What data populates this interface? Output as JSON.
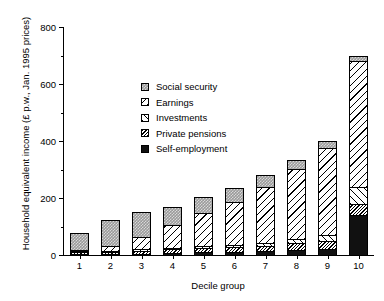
{
  "chart_data": {
    "type": "bar",
    "stacked": true,
    "title": "",
    "xlabel": "Decile group",
    "ylabel": "Household equivalent income (£ p.w., Jan. 1995 prices)",
    "categories": [
      "1",
      "2",
      "3",
      "4",
      "5",
      "6",
      "7",
      "8",
      "9",
      "10"
    ],
    "ylim": [
      0,
      800
    ],
    "yticks": [
      0,
      200,
      400,
      600,
      800
    ],
    "yticklabels": [
      "0",
      "200",
      "400",
      "600",
      "800"
    ],
    "yminorticks": [
      100,
      300,
      500,
      700
    ],
    "grid": false,
    "legend_position": "upper left",
    "series": [
      {
        "name": "Self-employment",
        "pattern": "solid-black",
        "color": "#111111",
        "values": [
          2,
          3,
          5,
          8,
          10,
          12,
          13,
          18,
          22,
          140
        ]
      },
      {
        "name": "Private pensions",
        "pattern": "dense-backslash",
        "color": "#ffffff",
        "values": [
          6,
          8,
          10,
          12,
          14,
          16,
          18,
          24,
          28,
          40
        ]
      },
      {
        "name": "Investments",
        "pattern": "forward-slash",
        "color": "#ffffff",
        "values": [
          2,
          4,
          5,
          6,
          7,
          8,
          10,
          16,
          22,
          60
        ]
      },
      {
        "name": "Earnings",
        "pattern": "backslash",
        "color": "#ffffff",
        "values": [
          4,
          18,
          45,
          78,
          117,
          150,
          196,
          243,
          303,
          440
        ]
      },
      {
        "name": "Social security",
        "pattern": "checkered-grey",
        "color": "#9a9a9a",
        "values": [
          63,
          89,
          86,
          66,
          57,
          51,
          43,
          34,
          25,
          20
        ]
      }
    ],
    "totals": [
      77,
      122,
      151,
      170,
      205,
      237,
      280,
      335,
      400,
      700
    ]
  },
  "legend": {
    "items": [
      {
        "label": "Social security",
        "swatch": "checkered-grey-swatch"
      },
      {
        "label": "Earnings",
        "swatch": "backslash-swatch"
      },
      {
        "label": "Investments",
        "swatch": "forward-slash-swatch"
      },
      {
        "label": "Private pensions",
        "swatch": "dense-backslash-swatch"
      },
      {
        "label": "Self-employment",
        "swatch": "solid-black-swatch"
      }
    ]
  }
}
